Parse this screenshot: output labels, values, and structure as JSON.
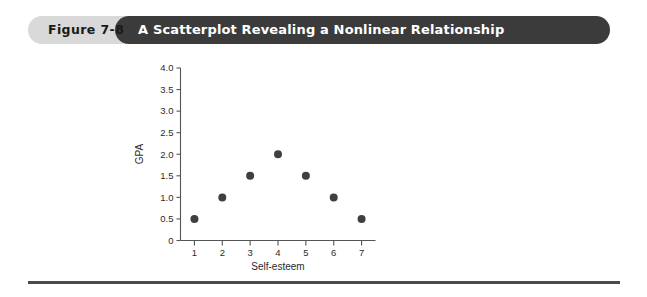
{
  "figure": {
    "number_label": "Figure 7-8",
    "title": "A Scatterplot Revealing a Nonlinear Relationship",
    "pill_color": "#d9d9d9",
    "title_bar_color": "#3b3b3b",
    "title_text_color": "#ffffff"
  },
  "chart_data": {
    "type": "scatter",
    "title": "A Scatterplot Revealing a Nonlinear Relationship",
    "xlabel": "Self-esteem",
    "ylabel": "GPA",
    "x": [
      1,
      2,
      3,
      4,
      5,
      6,
      7
    ],
    "values": [
      0.5,
      1.0,
      1.5,
      2.0,
      1.5,
      1.0,
      0.5
    ],
    "points": [
      {
        "x": 1,
        "y": 0.5
      },
      {
        "x": 2,
        "y": 1.0
      },
      {
        "x": 3,
        "y": 1.5
      },
      {
        "x": 4,
        "y": 2.0
      },
      {
        "x": 5,
        "y": 1.5
      },
      {
        "x": 6,
        "y": 1.0
      },
      {
        "x": 7,
        "y": 0.5
      }
    ],
    "xlim": [
      0.5,
      7.5
    ],
    "ylim": [
      0,
      4.0
    ],
    "xticks": [
      1,
      2,
      3,
      4,
      5,
      6,
      7
    ],
    "xticklabels": [
      "1",
      "2",
      "3",
      "4",
      "5",
      "6",
      "7"
    ],
    "yticks": [
      0,
      0.5,
      1.0,
      1.5,
      2.0,
      2.5,
      3.0,
      3.5,
      4.0
    ],
    "yticklabels": [
      "0",
      "0.5",
      "1.0",
      "1.5",
      "2.0",
      "2.5",
      "3.0",
      "3.5",
      "4.0"
    ],
    "grid": false,
    "legend": null,
    "marker_color": "#3f3f3f",
    "marker_size": 8
  }
}
